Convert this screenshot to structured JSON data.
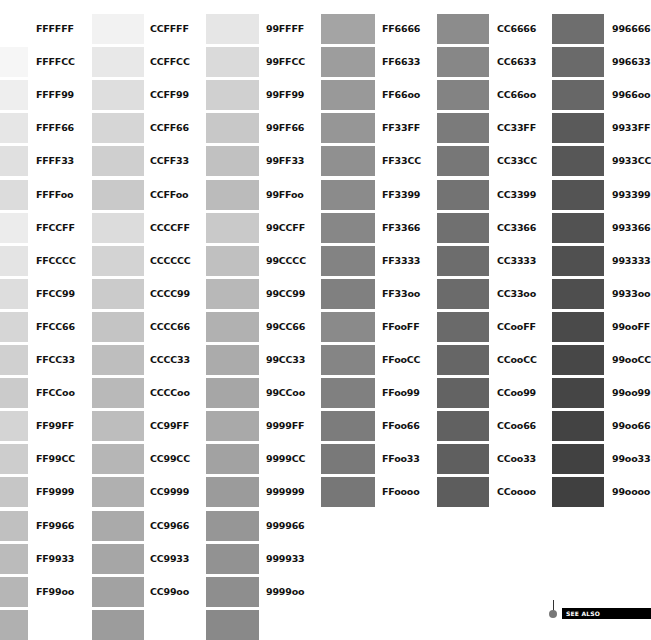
{
  "layout": {
    "row_top": 14,
    "row_pitch": 33.1,
    "swatch_height": 30
  },
  "columns": [
    {
      "swatch_x": -12,
      "swatch_w": 40,
      "label_x": 36,
      "first_swatch_row": 1,
      "items": [
        {
          "code": "FFFFFF",
          "gray": "#ffffff"
        },
        {
          "code": "FFFFCC",
          "gray": "#f6f6f6"
        },
        {
          "code": "FFFF99",
          "gray": "#eeeeee"
        },
        {
          "code": "FFFF66",
          "gray": "#e6e6e6"
        },
        {
          "code": "FFFF33",
          "gray": "#e0e0e0"
        },
        {
          "code": "FFFF00",
          "gray": "#dcdcdc"
        },
        {
          "code": "FFCCFF",
          "gray": "#ececec"
        },
        {
          "code": "FFCCCC",
          "gray": "#e4e4e4"
        },
        {
          "code": "FFCC99",
          "gray": "#dddddd"
        },
        {
          "code": "FFCC66",
          "gray": "#d6d6d6"
        },
        {
          "code": "FFCC33",
          "gray": "#d0d0d0"
        },
        {
          "code": "FFCC00",
          "gray": "#cbcbcb"
        },
        {
          "code": "FF99FF",
          "gray": "#d4d4d4"
        },
        {
          "code": "FF99CC",
          "gray": "#cdcdcd"
        },
        {
          "code": "FF9999",
          "gray": "#c6c6c6"
        },
        {
          "code": "FF9966",
          "gray": "#c0c0c0"
        },
        {
          "code": "FF9933",
          "gray": "#bbbbbb"
        },
        {
          "code": "FF9900",
          "gray": "#b6b6b6"
        }
      ]
    },
    {
      "swatch_x": 92,
      "swatch_w": 52,
      "label_x": 150,
      "first_swatch_row": 0,
      "items": [
        {
          "code": "CCFFFF",
          "gray": "#f2f2f2"
        },
        {
          "code": "CCFFCC",
          "gray": "#e8e8e8"
        },
        {
          "code": "CCFF99",
          "gray": "#dedede"
        },
        {
          "code": "CCFF66",
          "gray": "#d6d6d6"
        },
        {
          "code": "CCFF33",
          "gray": "#cfcfcf"
        },
        {
          "code": "CCFF00",
          "gray": "#c9c9c9"
        },
        {
          "code": "CCCCFF",
          "gray": "#dcdcdc"
        },
        {
          "code": "CCCCCC",
          "gray": "#d3d3d3"
        },
        {
          "code": "CCCC99",
          "gray": "#cbcbcb"
        },
        {
          "code": "CCCC66",
          "gray": "#c4c4c4"
        },
        {
          "code": "CCCC33",
          "gray": "#bebebe"
        },
        {
          "code": "CCCC00",
          "gray": "#b9b9b9"
        },
        {
          "code": "CC99FF",
          "gray": "#bdbdbd"
        },
        {
          "code": "CC99CC",
          "gray": "#b6b6b6"
        },
        {
          "code": "CC9999",
          "gray": "#b0b0b0"
        },
        {
          "code": "CC9966",
          "gray": "#aaaaaa"
        },
        {
          "code": "CC9933",
          "gray": "#a6a6a6"
        },
        {
          "code": "CC9900",
          "gray": "#a2a2a2"
        }
      ]
    },
    {
      "swatch_x": 206,
      "swatch_w": 53,
      "label_x": 266,
      "first_swatch_row": 0,
      "items": [
        {
          "code": "99FFFF",
          "gray": "#e6e6e6"
        },
        {
          "code": "99FFCC",
          "gray": "#dadada"
        },
        {
          "code": "99FF99",
          "gray": "#d0d0d0"
        },
        {
          "code": "99FF66",
          "gray": "#c8c8c8"
        },
        {
          "code": "99FF33",
          "gray": "#c1c1c1"
        },
        {
          "code": "99FF00",
          "gray": "#bbbbbb"
        },
        {
          "code": "99CCFF",
          "gray": "#c9c9c9"
        },
        {
          "code": "99CCCC",
          "gray": "#c0c0c0"
        },
        {
          "code": "99CC99",
          "gray": "#b8b8b8"
        },
        {
          "code": "99CC66",
          "gray": "#b1b1b1"
        },
        {
          "code": "99CC33",
          "gray": "#ababab"
        },
        {
          "code": "99CC00",
          "gray": "#a6a6a6"
        },
        {
          "code": "9999FF",
          "gray": "#a9a9a9"
        },
        {
          "code": "9999CC",
          "gray": "#a2a2a2"
        },
        {
          "code": "999999",
          "gray": "#9b9b9b"
        },
        {
          "code": "999966",
          "gray": "#969696"
        },
        {
          "code": "999933",
          "gray": "#929292"
        },
        {
          "code": "999900",
          "gray": "#8e8e8e"
        }
      ]
    },
    {
      "swatch_x": 321,
      "swatch_w": 54,
      "label_x": 382,
      "first_swatch_row": 0,
      "items": [
        {
          "code": "FF6666",
          "gray": "#a4a4a4"
        },
        {
          "code": "FF6633",
          "gray": "#9d9d9d"
        },
        {
          "code": "FF6600",
          "gray": "#999999"
        },
        {
          "code": "FF33FF",
          "gray": "#969696"
        },
        {
          "code": "FF33CC",
          "gray": "#909090"
        },
        {
          "code": "FF3399",
          "gray": "#8b8b8b"
        },
        {
          "code": "FF3366",
          "gray": "#878787"
        },
        {
          "code": "FF3333",
          "gray": "#838383"
        },
        {
          "code": "FF3300",
          "gray": "#808080"
        },
        {
          "code": "FF00FF",
          "gray": "#8a8a8a"
        },
        {
          "code": "FF00CC",
          "gray": "#858585"
        },
        {
          "code": "FF0099",
          "gray": "#808080"
        },
        {
          "code": "FF0066",
          "gray": "#7c7c7c"
        },
        {
          "code": "FF0033",
          "gray": "#797979"
        },
        {
          "code": "FF0000",
          "gray": "#777777"
        }
      ]
    },
    {
      "swatch_x": 437,
      "swatch_w": 52,
      "label_x": 497,
      "first_swatch_row": 0,
      "items": [
        {
          "code": "CC6666",
          "gray": "#8c8c8c"
        },
        {
          "code": "CC6633",
          "gray": "#878787"
        },
        {
          "code": "CC6600",
          "gray": "#838383"
        },
        {
          "code": "CC33FF",
          "gray": "#7b7b7b"
        },
        {
          "code": "CC33CC",
          "gray": "#777777"
        },
        {
          "code": "CC3399",
          "gray": "#737373"
        },
        {
          "code": "CC3366",
          "gray": "#707070"
        },
        {
          "code": "CC3333",
          "gray": "#6d6d6d"
        },
        {
          "code": "CC3300",
          "gray": "#6b6b6b"
        },
        {
          "code": "CC00FF",
          "gray": "#6a6a6a"
        },
        {
          "code": "CC00CC",
          "gray": "#666666"
        },
        {
          "code": "CC0099",
          "gray": "#636363"
        },
        {
          "code": "CC0066",
          "gray": "#616161"
        },
        {
          "code": "CC0033",
          "gray": "#5f5f5f"
        },
        {
          "code": "CC0000",
          "gray": "#5d5d5d"
        }
      ]
    },
    {
      "swatch_x": 552,
      "swatch_w": 52,
      "label_x": 612,
      "first_swatch_row": 0,
      "items": [
        {
          "code": "996666",
          "gray": "#6e6e6e"
        },
        {
          "code": "996633",
          "gray": "#6a6a6a"
        },
        {
          "code": "996600",
          "gray": "#676767"
        },
        {
          "code": "9933FF",
          "gray": "#5a5a5a"
        },
        {
          "code": "9933CC",
          "gray": "#575757"
        },
        {
          "code": "993399",
          "gray": "#545454"
        },
        {
          "code": "993366",
          "gray": "#525252"
        },
        {
          "code": "993333",
          "gray": "#505050"
        },
        {
          "code": "993300",
          "gray": "#4e4e4e"
        },
        {
          "code": "9900FF",
          "gray": "#4a4a4a"
        },
        {
          "code": "9900CC",
          "gray": "#474747"
        },
        {
          "code": "990099",
          "gray": "#454545"
        },
        {
          "code": "990066",
          "gray": "#434343"
        },
        {
          "code": "990033",
          "gray": "#414141"
        },
        {
          "code": "990000",
          "gray": "#404040"
        }
      ]
    }
  ],
  "extra_swatches_bottom": [
    {
      "col": 0,
      "gray": "#b0b0b0"
    },
    {
      "col": 1,
      "gray": "#9c9c9c"
    },
    {
      "col": 2,
      "gray": "#898989"
    }
  ],
  "see_also": {
    "label": "SEE ALSO"
  }
}
